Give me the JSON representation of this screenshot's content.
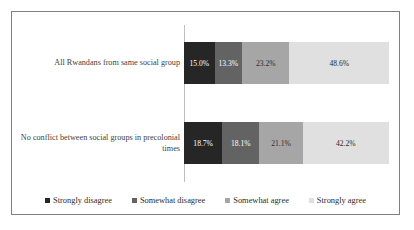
{
  "chart_data": {
    "type": "bar",
    "orientation": "horizontal",
    "stacked": true,
    "normalized_percent": true,
    "title": "",
    "subtitle": "",
    "xlabel": "",
    "ylabel": "",
    "xlim": [
      0,
      100
    ],
    "grid": false,
    "legend_position": "bottom",
    "categories": [
      "All Rwandans from same social group",
      "No conflict between social groups in precolonial times"
    ],
    "series": [
      {
        "name": "Strongly disagree",
        "color": "#262626",
        "values": [
          15.0,
          18.7
        ],
        "labels": [
          "15.0%",
          "18.7%"
        ]
      },
      {
        "name": "Somewhat disagree",
        "color": "#636363",
        "values": [
          13.3,
          18.1
        ],
        "labels": [
          "13.3%",
          "18.1%"
        ]
      },
      {
        "name": "Somewhat agree",
        "color": "#a6a6a6",
        "values": [
          23.2,
          21.1
        ],
        "labels": [
          "23.2%",
          "21.1%"
        ]
      },
      {
        "name": "Strongly agree",
        "color": "#e0e0e0",
        "values": [
          48.6,
          42.2
        ],
        "labels": [
          "48.6%",
          "42.2%"
        ]
      }
    ]
  },
  "rows": [
    {
      "label": "All Rwandans from same social group",
      "segments": [
        {
          "label": "15.0%",
          "color": "#262626",
          "text_color": "#ffffff",
          "width_pct": 15.0
        },
        {
          "label": "13.3%",
          "color": "#636363",
          "text_color": "#ffffff",
          "width_pct": 13.3
        },
        {
          "label": "23.2%",
          "color": "#a6a6a6",
          "text_color": "#2b2b2b",
          "width_pct": 23.2
        },
        {
          "label": "48.6%",
          "color": "#e0e0e0",
          "text_color": "#2b2b2b",
          "width_pct": 48.6
        }
      ]
    },
    {
      "label": "No conflict between social groups in precolonial times",
      "segments": [
        {
          "label": "18.7%",
          "color": "#262626",
          "text_color": "#ffffff",
          "width_pct": 18.7
        },
        {
          "label": "18.1%",
          "color": "#636363",
          "text_color": "#ffffff",
          "width_pct": 18.1
        },
        {
          "label": "21.1%",
          "color": "#a6a6a6",
          "text_color": "#2b2b2b",
          "width_pct": 21.1
        },
        {
          "label": "42.2%",
          "color": "#e0e0e0",
          "text_color": "#2b2b2b",
          "width_pct": 42.2
        }
      ]
    }
  ],
  "legend": {
    "items": [
      {
        "label": "Strongly disagree",
        "color": "#262626"
      },
      {
        "label": "Somewhat disagree",
        "color": "#636363"
      },
      {
        "label": "Somewhat agree",
        "color": "#a6a6a6"
      },
      {
        "label": "Strongly agree",
        "color": "#e0e0e0"
      }
    ]
  },
  "style": {
    "border_color": "#808080",
    "axis_line_color": "#bfbfbf",
    "background": "#ffffff",
    "label_color": "#3f3f3f"
  }
}
